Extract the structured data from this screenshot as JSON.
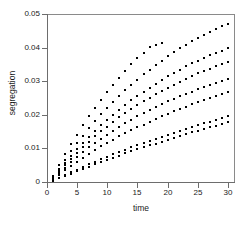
{
  "figure": {
    "background": "#ffffff",
    "frame_color": "#8a8a8a",
    "marker_color": "#000000",
    "marker_shape": "square"
  },
  "axes": {
    "x": {
      "label": "time",
      "ticks": [
        0,
        5,
        10,
        15,
        20,
        25,
        30
      ],
      "tick_labels": [
        "0",
        "5",
        "10",
        "15",
        "20",
        "25",
        "30"
      ],
      "range": [
        0,
        31
      ]
    },
    "y": {
      "label": "segregation",
      "ticks": [
        0,
        0.01,
        0.02,
        0.03,
        0.04,
        0.05
      ],
      "tick_labels": [
        "0",
        "0.01",
        "0.02",
        "0.03",
        "0.04",
        "0.05"
      ],
      "range": [
        0,
        0.05
      ]
    }
  },
  "chart_data": {
    "type": "scatter",
    "title": "",
    "xlabel": "time",
    "ylabel": "segregation",
    "xlim": [
      0,
      31
    ],
    "ylim": [
      0,
      0.05
    ],
    "grid": false,
    "legend": "none",
    "marker": "square",
    "marker_color": "#000000",
    "marker_size_px": 2,
    "x": [
      1,
      2,
      3,
      4,
      5,
      6,
      7,
      8,
      9,
      10,
      11,
      12,
      13,
      14,
      15,
      16,
      17,
      18,
      19,
      20,
      21,
      22,
      23,
      24,
      25,
      26,
      27,
      28,
      29,
      30
    ],
    "series": [
      {
        "name": "series-1",
        "values": [
          0.0018,
          0.005,
          0.0082,
          0.0112,
          0.0141,
          0.0169,
          0.0196,
          0.0221,
          0.0245,
          0.0268,
          0.029,
          0.0311,
          0.0331,
          0.035,
          0.0368,
          0.0385,
          0.0401,
          0.0409,
          0.0415,
          null,
          null,
          null,
          null,
          null,
          null,
          null,
          null,
          null,
          null,
          null
        ]
      },
      {
        "name": "series-2",
        "values": [
          0.0015,
          0.004,
          0.0066,
          0.0091,
          0.0115,
          0.0138,
          0.016,
          0.0181,
          0.0201,
          0.022,
          0.0238,
          0.0256,
          0.0273,
          0.0289,
          0.0305,
          0.032,
          0.0334,
          0.0348,
          0.0361,
          0.0374,
          0.0386,
          0.0398,
          0.0409,
          0.0419,
          0.0429,
          0.0438,
          0.0447,
          0.0456,
          0.0463,
          0.047
        ]
      },
      {
        "name": "series-3",
        "values": [
          0.0013,
          0.0034,
          0.0056,
          0.0077,
          0.0097,
          0.0116,
          0.0134,
          0.0152,
          0.0169,
          0.0185,
          0.02,
          0.0215,
          0.0229,
          0.0243,
          0.0256,
          0.0269,
          0.0281,
          0.0293,
          0.0304,
          0.0314,
          0.0325,
          0.0334,
          0.0344,
          0.0353,
          0.0361,
          0.0369,
          0.0377,
          0.0384,
          0.0391,
          0.0398
        ]
      },
      {
        "name": "series-4",
        "values": [
          0.0012,
          0.0031,
          0.005,
          0.0069,
          0.0087,
          0.0104,
          0.012,
          0.0136,
          0.0151,
          0.0165,
          0.0179,
          0.0192,
          0.0205,
          0.0217,
          0.0229,
          0.024,
          0.0251,
          0.0261,
          0.0271,
          0.0281,
          0.029,
          0.0299,
          0.0307,
          0.0315,
          0.0323,
          0.033,
          0.0337,
          0.0344,
          0.0351,
          0.0357
        ]
      },
      {
        "name": "series-5",
        "values": [
          0.001,
          0.0026,
          0.0043,
          0.0059,
          0.0074,
          0.0089,
          0.0103,
          0.0116,
          0.0129,
          0.0141,
          0.0153,
          0.0164,
          0.0175,
          0.0186,
          0.0196,
          0.0205,
          0.0214,
          0.0223,
          0.0232,
          0.024,
          0.0248,
          0.0255,
          0.0262,
          0.0269,
          0.0276,
          0.0282,
          0.0288,
          0.0294,
          0.03,
          0.0306
        ]
      },
      {
        "name": "series-6",
        "values": [
          0.0008,
          0.0021,
          0.0035,
          0.0048,
          0.006,
          0.0072,
          0.0084,
          0.0095,
          0.0106,
          0.0116,
          0.0126,
          0.0136,
          0.0145,
          0.0154,
          0.0163,
          0.0171,
          0.018,
          0.0188,
          0.0195,
          0.0203,
          0.021,
          0.0217,
          0.0224,
          0.0231,
          0.0237,
          0.0244,
          0.025,
          0.0256,
          0.0262,
          0.0268
        ]
      },
      {
        "name": "series-7",
        "values": [
          0.0005,
          0.0013,
          0.0021,
          0.0029,
          0.0037,
          0.0045,
          0.0053,
          0.006,
          0.0068,
          0.0075,
          0.0082,
          0.0089,
          0.0096,
          0.0103,
          0.0109,
          0.0116,
          0.0122,
          0.0128,
          0.0134,
          0.014,
          0.0146,
          0.0152,
          0.0158,
          0.0164,
          0.0169,
          0.0175,
          0.018,
          0.0186,
          0.0191,
          0.0196
        ]
      },
      {
        "name": "series-8",
        "values": [
          0.0004,
          0.0011,
          0.0018,
          0.0025,
          0.0032,
          0.0039,
          0.0046,
          0.0053,
          0.0059,
          0.0066,
          0.0072,
          0.0078,
          0.0085,
          0.0091,
          0.0097,
          0.0103,
          0.0109,
          0.0114,
          0.012,
          0.0126,
          0.0131,
          0.0137,
          0.0142,
          0.0148,
          0.0153,
          0.0158,
          0.0163,
          0.0168,
          0.0173,
          0.0178
        ]
      }
    ]
  }
}
